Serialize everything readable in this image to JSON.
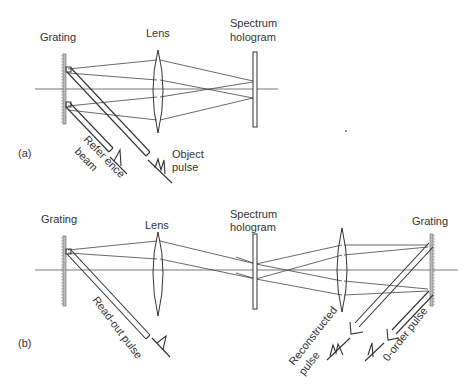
{
  "panel_a": {
    "tag": "(a)",
    "grating_label": "Grating",
    "lens_label": "Lens",
    "hologram_label_line1": "Spectrum",
    "hologram_label_line2": "hologram",
    "reference_beam_line1": "Refer ence",
    "reference_beam_line2": "beam",
    "object_pulse_line1": "Object",
    "object_pulse_line2": "pulse"
  },
  "panel_b": {
    "tag": "(b)",
    "grating_left_label": "Grating",
    "lens_left_label": "Lens",
    "hologram_label_line1": "Spectrum",
    "hologram_label_line2": "hologram",
    "grating_right_label": "Grating",
    "readout_pulse_label": "Read-out pulse",
    "reconstructed_line1": "Reconstructed",
    "reconstructed_line2": "pulse",
    "zero_order_label": "0-order pulse"
  }
}
